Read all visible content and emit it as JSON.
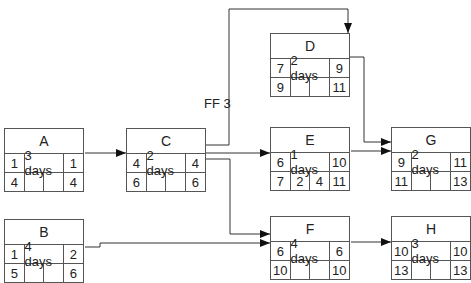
{
  "diagram": {
    "type": "precedence-network",
    "nodes": [
      {
        "id": "A",
        "duration": "3 days",
        "es": "1",
        "ef": "1",
        "ls": "4",
        "ff_val": "",
        "tf": "",
        "lf": "4"
      },
      {
        "id": "B",
        "duration": "4 days",
        "es": "1",
        "ef": "2",
        "ls": "5",
        "ff_val": "",
        "tf": "",
        "lf": "6"
      },
      {
        "id": "C",
        "duration": "2 days",
        "es": "4",
        "ef": "4",
        "ls": "6",
        "ff_val": "",
        "tf": "",
        "lf": "6"
      },
      {
        "id": "D",
        "duration": "2 days",
        "es": "7",
        "ef": "9",
        "ls": "9",
        "ff_val": "",
        "tf": "",
        "lf": "11"
      },
      {
        "id": "E",
        "duration": "1 days",
        "es": "6",
        "ef": "10",
        "ls": "7",
        "ff_val": "2",
        "tf": "4",
        "lf": "11"
      },
      {
        "id": "F",
        "duration": "4 days",
        "es": "6",
        "ef": "6",
        "ls": "10",
        "ff_val": "",
        "tf": "",
        "lf": "10"
      },
      {
        "id": "G",
        "duration": "2 days",
        "es": "9",
        "ef": "11",
        "ls": "11",
        "ff_val": "",
        "tf": "",
        "lf": "13"
      },
      {
        "id": "H",
        "duration": "3 days",
        "es": "10",
        "ef": "10",
        "ls": "13",
        "ff_val": "",
        "tf": "",
        "lf": "13"
      }
    ],
    "edges": [
      {
        "from": "A",
        "to": "C"
      },
      {
        "from": "C",
        "to": "D",
        "label": "FF 3"
      },
      {
        "from": "C",
        "to": "E"
      },
      {
        "from": "C",
        "to": "F"
      },
      {
        "from": "B",
        "to": "F"
      },
      {
        "from": "D",
        "to": "G"
      },
      {
        "from": "E",
        "to": "G"
      },
      {
        "from": "F",
        "to": "H"
      }
    ],
    "lag_label": "FF 3"
  }
}
